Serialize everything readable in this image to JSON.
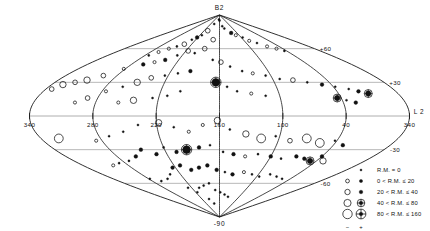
{
  "figure": {
    "projection": "sinusoidal",
    "coordinate_system": "galactic",
    "axis_x_name": "L 2",
    "pole_north_label": "B2",
    "pole_south_label": "-90"
  },
  "axes": {
    "longitude_ticks": [
      "340",
      "280",
      "220",
      "160",
      "100",
      "40",
      "340"
    ],
    "longitude_tick_values": [
      340,
      280,
      220,
      160,
      100,
      40,
      340
    ],
    "latitude_ticks": [
      "+60",
      "+30",
      "-30",
      "-60"
    ],
    "latitude_tick_values": [
      60,
      30,
      -30,
      -60
    ]
  },
  "legend": {
    "rows": [
      {
        "label": "R.M.  =    0",
        "size": 1.0,
        "open": false,
        "cross": false,
        "show_open": false
      },
      {
        "label": "0  <  R.M.  ≤   20",
        "size": 1.6,
        "open": true,
        "cross": false,
        "show_open": true
      },
      {
        "label": "20  <  R.M.  ≤   40",
        "size": 2.4,
        "open": true,
        "cross": false,
        "show_open": true
      },
      {
        "label": "40  <  R.M.  ≤   80",
        "size": 3.3,
        "open": true,
        "cross": true,
        "show_open": true
      },
      {
        "label": "80  <  R.M.  ≤  160",
        "size": 4.4,
        "open": true,
        "cross": true,
        "show_open": true
      }
    ],
    "sign_negative": "−",
    "sign_positive": "+"
  },
  "chart_data": {
    "type": "scatter",
    "title": "",
    "subtitle": "",
    "xlabel": "L 2",
    "ylabel": "B2",
    "xlim": [
      340,
      -20
    ],
    "ylim": [
      -90,
      90
    ],
    "grid": true,
    "legend_position": "bottom-right",
    "x_tick_labels": [
      "340",
      "280",
      "220",
      "160",
      "100",
      "40",
      "340"
    ],
    "y_tick_labels": [
      "+60",
      "+30",
      "-30",
      "-60"
    ],
    "series": [
      {
        "name": "Rotation measure sources",
        "encoding": {
          "x": "galactic longitude (deg)",
          "y": "galactic latitude (deg)",
          "size": "|R.M.| magnitude bin",
          "fill": "filled = positive R.M., open = negative R.M."
        },
        "points": [
          {
            "l": 168,
            "b": 86,
            "rm_bin": 1,
            "sign": 1
          },
          {
            "l": 160,
            "b": 85,
            "rm_bin": 1,
            "sign": 1
          },
          {
            "l": 145,
            "b": 80,
            "rm_bin": 1,
            "sign": 1
          },
          {
            "l": 138,
            "b": 78,
            "rm_bin": 1,
            "sign": 1
          },
          {
            "l": 120,
            "b": 74,
            "rm_bin": 2,
            "sign": 1
          },
          {
            "l": 110,
            "b": 72,
            "rm_bin": 1,
            "sign": -1
          },
          {
            "l": 96,
            "b": 70,
            "rm_bin": 1,
            "sign": 1
          },
          {
            "l": 88,
            "b": 67,
            "rm_bin": 1,
            "sign": -1
          },
          {
            "l": 76,
            "b": 65,
            "rm_bin": 1,
            "sign": 1
          },
          {
            "l": 64,
            "b": 62,
            "rm_bin": 1,
            "sign": -1
          },
          {
            "l": 52,
            "b": 60,
            "rm_bin": 1,
            "sign": -1
          },
          {
            "l": 44,
            "b": 58,
            "rm_bin": 1,
            "sign": 1
          },
          {
            "l": 196,
            "b": 82,
            "rm_bin": 1,
            "sign": 1
          },
          {
            "l": 206,
            "b": 76,
            "rm_bin": 2,
            "sign": -1
          },
          {
            "l": 214,
            "b": 72,
            "rm_bin": 1,
            "sign": 1
          },
          {
            "l": 222,
            "b": 70,
            "rm_bin": 2,
            "sign": 1
          },
          {
            "l": 230,
            "b": 68,
            "rm_bin": 1,
            "sign": 1
          },
          {
            "l": 236,
            "b": 64,
            "rm_bin": 2,
            "sign": -1
          },
          {
            "l": 246,
            "b": 62,
            "rm_bin": 1,
            "sign": 1
          },
          {
            "l": 256,
            "b": 60,
            "rm_bin": 1,
            "sign": -1
          },
          {
            "l": 266,
            "b": 57,
            "rm_bin": 1,
            "sign": -1
          },
          {
            "l": 274,
            "b": 54,
            "rm_bin": 1,
            "sign": 1
          },
          {
            "l": 176,
            "b": 68,
            "rm_bin": 2,
            "sign": -1
          },
          {
            "l": 188,
            "b": 60,
            "rm_bin": 2,
            "sign": -1
          },
          {
            "l": 202,
            "b": 56,
            "rm_bin": 1,
            "sign": 1
          },
          {
            "l": 216,
            "b": 58,
            "rm_bin": 2,
            "sign": -1
          },
          {
            "l": 228,
            "b": 54,
            "rm_bin": 1,
            "sign": 1
          },
          {
            "l": 240,
            "b": 50,
            "rm_bin": 2,
            "sign": 1
          },
          {
            "l": 252,
            "b": 48,
            "rm_bin": 1,
            "sign": -1
          },
          {
            "l": 264,
            "b": 46,
            "rm_bin": 2,
            "sign": 1
          },
          {
            "l": 282,
            "b": 42,
            "rm_bin": 1,
            "sign": -1
          },
          {
            "l": 296,
            "b": 36,
            "rm_bin": 2,
            "sign": -1
          },
          {
            "l": 308,
            "b": 32,
            "rm_bin": 3,
            "sign": -1
          },
          {
            "l": 318,
            "b": 30,
            "rm_bin": 2,
            "sign": -1
          },
          {
            "l": 328,
            "b": 28,
            "rm_bin": 3,
            "sign": -1
          },
          {
            "l": 334,
            "b": 24,
            "rm_bin": 2,
            "sign": -1
          },
          {
            "l": 170,
            "b": 50,
            "rm_bin": 1,
            "sign": 1
          },
          {
            "l": 158,
            "b": 48,
            "rm_bin": 2,
            "sign": -1
          },
          {
            "l": 146,
            "b": 44,
            "rm_bin": 1,
            "sign": 1
          },
          {
            "l": 132,
            "b": 40,
            "rm_bin": 1,
            "sign": 1
          },
          {
            "l": 120,
            "b": 38,
            "rm_bin": 1,
            "sign": -1
          },
          {
            "l": 106,
            "b": 36,
            "rm_bin": 1,
            "sign": 1
          },
          {
            "l": 92,
            "b": 33,
            "rm_bin": 1,
            "sign": 1
          },
          {
            "l": 78,
            "b": 32,
            "rm_bin": 2,
            "sign": -1
          },
          {
            "l": 64,
            "b": 30,
            "rm_bin": 1,
            "sign": 1
          },
          {
            "l": 50,
            "b": 28,
            "rm_bin": 2,
            "sign": 1
          },
          {
            "l": 38,
            "b": 26,
            "rm_bin": 1,
            "sign": 1
          },
          {
            "l": 26,
            "b": 24,
            "rm_bin": 1,
            "sign": 1
          },
          {
            "l": 18,
            "b": 22,
            "rm_bin": 2,
            "sign": 1
          },
          {
            "l": 10,
            "b": 20,
            "rm_bin": 3,
            "sign": 1
          },
          {
            "l": 196,
            "b": 40,
            "rm_bin": 2,
            "sign": 1
          },
          {
            "l": 210,
            "b": 38,
            "rm_bin": 1,
            "sign": 1
          },
          {
            "l": 224,
            "b": 36,
            "rm_bin": 1,
            "sign": 1
          },
          {
            "l": 238,
            "b": 34,
            "rm_bin": 2,
            "sign": -1
          },
          {
            "l": 250,
            "b": 30,
            "rm_bin": 3,
            "sign": -1
          },
          {
            "l": 262,
            "b": 26,
            "rm_bin": 1,
            "sign": 1
          },
          {
            "l": 276,
            "b": 22,
            "rm_bin": 1,
            "sign": -1
          },
          {
            "l": 164,
            "b": 30,
            "rm_bin": 4,
            "sign": 1
          },
          {
            "l": 152,
            "b": 26,
            "rm_bin": 1,
            "sign": 1
          },
          {
            "l": 142,
            "b": 22,
            "rm_bin": 1,
            "sign": 1
          },
          {
            "l": 128,
            "b": 20,
            "rm_bin": 1,
            "sign": -1
          },
          {
            "l": 114,
            "b": 18,
            "rm_bin": 1,
            "sign": 1
          },
          {
            "l": 44,
            "b": 16,
            "rm_bin": 3,
            "sign": 1
          },
          {
            "l": 36,
            "b": 14,
            "rm_bin": 1,
            "sign": 1
          },
          {
            "l": 28,
            "b": 12,
            "rm_bin": 2,
            "sign": 1
          },
          {
            "l": 200,
            "b": 22,
            "rm_bin": 1,
            "sign": 1
          },
          {
            "l": 212,
            "b": 18,
            "rm_bin": 1,
            "sign": 1
          },
          {
            "l": 226,
            "b": 16,
            "rm_bin": 1,
            "sign": 1
          },
          {
            "l": 244,
            "b": 14,
            "rm_bin": 3,
            "sign": -1
          },
          {
            "l": 258,
            "b": 12,
            "rm_bin": 1,
            "sign": -1
          },
          {
            "l": 290,
            "b": 16,
            "rm_bin": 2,
            "sign": -1
          },
          {
            "l": 300,
            "b": 12,
            "rm_bin": 1,
            "sign": -1
          },
          {
            "l": 218,
            "b": -6,
            "rm_bin": 3,
            "sign": -1
          },
          {
            "l": 204,
            "b": -10,
            "rm_bin": 1,
            "sign": 1
          },
          {
            "l": 190,
            "b": -14,
            "rm_bin": 1,
            "sign": -1
          },
          {
            "l": 176,
            "b": -8,
            "rm_bin": 1,
            "sign": -1
          },
          {
            "l": 162,
            "b": -4,
            "rm_bin": 3,
            "sign": -1
          },
          {
            "l": 150,
            "b": -12,
            "rm_bin": 1,
            "sign": 1
          },
          {
            "l": 134,
            "b": -16,
            "rm_bin": 3,
            "sign": -1
          },
          {
            "l": 118,
            "b": -20,
            "rm_bin": 4,
            "sign": -1
          },
          {
            "l": 104,
            "b": -18,
            "rm_bin": 1,
            "sign": 1
          },
          {
            "l": 88,
            "b": -22,
            "rm_bin": 2,
            "sign": -1
          },
          {
            "l": 72,
            "b": -20,
            "rm_bin": 4,
            "sign": -1
          },
          {
            "l": 56,
            "b": -24,
            "rm_bin": 4,
            "sign": -1
          },
          {
            "l": 42,
            "b": -22,
            "rm_bin": 1,
            "sign": 1
          },
          {
            "l": 30,
            "b": -26,
            "rm_bin": 2,
            "sign": 1
          },
          {
            "l": 238,
            "b": -8,
            "rm_bin": 1,
            "sign": 1
          },
          {
            "l": 254,
            "b": -14,
            "rm_bin": 1,
            "sign": 1
          },
          {
            "l": 270,
            "b": -18,
            "rm_bin": 1,
            "sign": 1
          },
          {
            "l": 286,
            "b": -22,
            "rm_bin": 1,
            "sign": -1
          },
          {
            "l": 322,
            "b": -20,
            "rm_bin": 4,
            "sign": -1
          },
          {
            "l": 170,
            "b": -26,
            "rm_bin": 1,
            "sign": 1
          },
          {
            "l": 182,
            "b": -28,
            "rm_bin": 2,
            "sign": 1
          },
          {
            "l": 196,
            "b": -30,
            "rm_bin": 4,
            "sign": 1
          },
          {
            "l": 208,
            "b": -32,
            "rm_bin": 2,
            "sign": 1
          },
          {
            "l": 220,
            "b": -28,
            "rm_bin": 1,
            "sign": 1
          },
          {
            "l": 232,
            "b": -34,
            "rm_bin": 2,
            "sign": 1
          },
          {
            "l": 246,
            "b": -30,
            "rm_bin": 2,
            "sign": 1
          },
          {
            "l": 156,
            "b": -32,
            "rm_bin": 1,
            "sign": 1
          },
          {
            "l": 144,
            "b": -34,
            "rm_bin": 2,
            "sign": 1
          },
          {
            "l": 130,
            "b": -36,
            "rm_bin": 1,
            "sign": -1
          },
          {
            "l": 116,
            "b": -34,
            "rm_bin": 1,
            "sign": 1
          },
          {
            "l": 100,
            "b": -36,
            "rm_bin": 2,
            "sign": 1
          },
          {
            "l": 86,
            "b": -38,
            "rm_bin": 1,
            "sign": 1
          },
          {
            "l": 70,
            "b": -36,
            "rm_bin": 2,
            "sign": 1
          },
          {
            "l": 58,
            "b": -38,
            "rm_bin": 2,
            "sign": 1
          },
          {
            "l": 48,
            "b": -40,
            "rm_bin": 3,
            "sign": 1
          },
          {
            "l": 40,
            "b": -36,
            "rm_bin": 2,
            "sign": 1
          },
          {
            "l": 32,
            "b": -40,
            "rm_bin": 3,
            "sign": -1
          },
          {
            "l": 258,
            "b": -36,
            "rm_bin": 2,
            "sign": 1
          },
          {
            "l": 272,
            "b": -40,
            "rm_bin": 1,
            "sign": 1
          },
          {
            "l": 288,
            "b": -42,
            "rm_bin": 1,
            "sign": 1
          },
          {
            "l": 300,
            "b": -44,
            "rm_bin": 1,
            "sign": -1
          },
          {
            "l": 176,
            "b": -44,
            "rm_bin": 2,
            "sign": 1
          },
          {
            "l": 188,
            "b": -46,
            "rm_bin": 2,
            "sign": 1
          },
          {
            "l": 200,
            "b": -48,
            "rm_bin": 2,
            "sign": 1
          },
          {
            "l": 212,
            "b": -44,
            "rm_bin": 2,
            "sign": 1
          },
          {
            "l": 224,
            "b": -46,
            "rm_bin": 2,
            "sign": 1
          },
          {
            "l": 164,
            "b": -48,
            "rm_bin": 2,
            "sign": 1
          },
          {
            "l": 152,
            "b": -50,
            "rm_bin": 1,
            "sign": 1
          },
          {
            "l": 140,
            "b": -52,
            "rm_bin": 2,
            "sign": 1
          },
          {
            "l": 124,
            "b": -50,
            "rm_bin": 1,
            "sign": -1
          },
          {
            "l": 110,
            "b": -52,
            "rm_bin": 1,
            "sign": 1
          },
          {
            "l": 96,
            "b": -54,
            "rm_bin": 1,
            "sign": 1
          },
          {
            "l": 82,
            "b": -52,
            "rm_bin": 1,
            "sign": 1
          },
          {
            "l": 68,
            "b": -54,
            "rm_bin": 1,
            "sign": 1
          },
          {
            "l": 54,
            "b": -56,
            "rm_bin": 1,
            "sign": 1
          },
          {
            "l": 236,
            "b": -52,
            "rm_bin": 1,
            "sign": 1
          },
          {
            "l": 248,
            "b": -56,
            "rm_bin": 1,
            "sign": 1
          },
          {
            "l": 264,
            "b": -58,
            "rm_bin": 1,
            "sign": 1
          },
          {
            "l": 278,
            "b": -56,
            "rm_bin": 1,
            "sign": 1
          },
          {
            "l": 180,
            "b": -60,
            "rm_bin": 1,
            "sign": 1
          },
          {
            "l": 192,
            "b": -62,
            "rm_bin": 1,
            "sign": 1
          },
          {
            "l": 204,
            "b": -64,
            "rm_bin": 1,
            "sign": 1
          },
          {
            "l": 170,
            "b": -66,
            "rm_bin": 1,
            "sign": 1
          },
          {
            "l": 158,
            "b": -68,
            "rm_bin": 1,
            "sign": 1
          },
          {
            "l": 146,
            "b": -70,
            "rm_bin": 1,
            "sign": 1
          },
          {
            "l": 216,
            "b": -68,
            "rm_bin": 1,
            "sign": 1
          },
          {
            "l": 228,
            "b": -64,
            "rm_bin": 1,
            "sign": 1
          },
          {
            "l": 134,
            "b": -72,
            "rm_bin": 1,
            "sign": 1
          },
          {
            "l": 196,
            "b": -74,
            "rm_bin": 1,
            "sign": 1
          },
          {
            "l": 184,
            "b": -78,
            "rm_bin": 1,
            "sign": 1
          }
        ]
      }
    ]
  }
}
